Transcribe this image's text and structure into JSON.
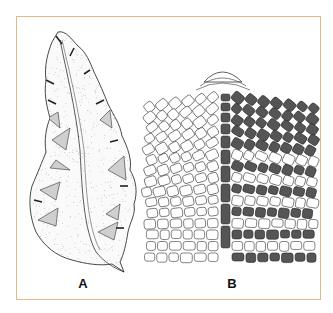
{
  "figure": {
    "frame_color": "#e0b98a",
    "panels": [
      {
        "id": "A",
        "label": "A",
        "description": "Leaf-like thallus with midrib, stippled, with shaded marginal notches"
      },
      {
        "id": "B",
        "label": "B",
        "description": "Apical cell lattice with dark-filled cell rows on right half"
      }
    ],
    "colors": {
      "ink": "#333333",
      "dark_cells": "#555555",
      "shade": "#cfcfcf"
    }
  }
}
